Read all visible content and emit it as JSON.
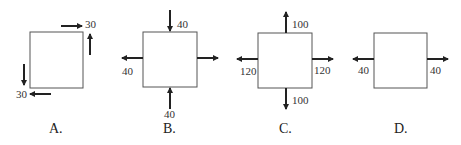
{
  "diagrams": [
    {
      "label": "A.",
      "forces": [
        {
          "direction": "right",
          "position": "top edge",
          "value": "30"
        },
        {
          "direction": "up",
          "position": "right edge",
          "value": ""
        },
        {
          "direction": "down",
          "position": "left edge",
          "value": ""
        },
        {
          "direction": "left",
          "position": "bottom edge",
          "value": "30"
        }
      ],
      "labels": {
        "top": "30",
        "bottom": "30"
      }
    },
    {
      "label": "B.",
      "forces": [
        {
          "direction": "down",
          "position": "top",
          "value": "40"
        },
        {
          "direction": "up",
          "position": "bottom",
          "value": "40"
        },
        {
          "direction": "left",
          "position": "left",
          "value": "40"
        },
        {
          "direction": "right",
          "position": "right",
          "value": ""
        }
      ],
      "labels": {
        "top": "40",
        "left": "40",
        "bottom": "40"
      }
    },
    {
      "label": "C.",
      "forces": [
        {
          "direction": "up",
          "position": "top",
          "value": "100"
        },
        {
          "direction": "down",
          "position": "bottom",
          "value": "100"
        },
        {
          "direction": "left",
          "position": "left",
          "value": "120"
        },
        {
          "direction": "right",
          "position": "right",
          "value": "120"
        }
      ],
      "labels": {
        "top": "100",
        "bottom": "100",
        "left": "120",
        "right": "120"
      }
    },
    {
      "label": "D.",
      "forces": [
        {
          "direction": "left",
          "position": "left",
          "value": "40"
        },
        {
          "direction": "right",
          "position": "right",
          "value": "40"
        }
      ],
      "labels": {
        "left": "40",
        "right": "40"
      }
    }
  ]
}
